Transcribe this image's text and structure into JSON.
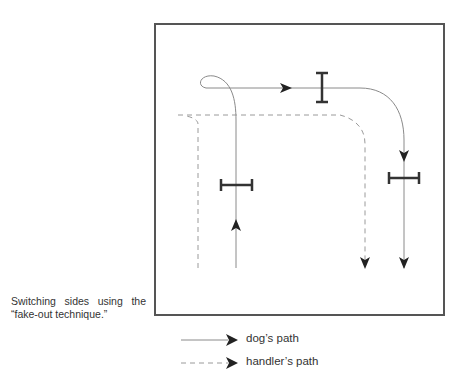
{
  "figure": {
    "caption_line1": "Switching sides using the",
    "caption_line2": "“fake-out technique.”",
    "legend": [
      {
        "label": "dog’s path",
        "style": "solid"
      },
      {
        "label": "handler’s path",
        "style": "dashed"
      }
    ],
    "colors": {
      "box": "#555555",
      "dog_path": "#8a8a8a",
      "handler_path": "#9a9a9a",
      "arrow": "#222222",
      "jump": "#333333"
    }
  }
}
